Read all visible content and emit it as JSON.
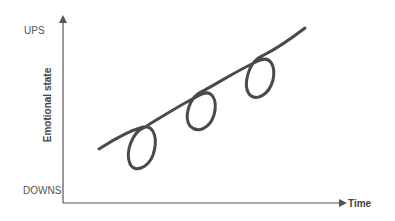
{
  "diagram": {
    "y_axis": {
      "label": "Emotional state",
      "top_label": "UPS",
      "bottom_label": "DOWNS"
    },
    "x_axis": {
      "label": "Time"
    },
    "curve": {
      "description": "Rising spiral line with three downward loops",
      "loop_count": 3
    },
    "colors": {
      "axis": "#555555",
      "curve": "#4a4a4a",
      "text": "#555555"
    }
  }
}
